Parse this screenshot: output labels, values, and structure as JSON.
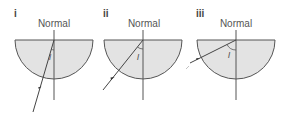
{
  "figure": {
    "panels": [
      {
        "id": "i",
        "label": "i",
        "normal_label": "Normal",
        "angle_label": "I",
        "center_x": 54,
        "ray_start": [
          37,
          112
        ],
        "ray_end": [
          54,
          40
        ]
      },
      {
        "id": "ii",
        "label": "ii",
        "normal_label": "Normal",
        "angle_label": "I",
        "center_x": 143,
        "ray_start": [
          103,
          90
        ],
        "ray_end": [
          143,
          40
        ]
      },
      {
        "id": "iii",
        "label": "iii",
        "normal_label": "Normal",
        "angle_label": "I",
        "center_x": 236,
        "ray_start": [
          190,
          63
        ],
        "ray_end": [
          236,
          40
        ]
      }
    ],
    "colors": {
      "block_fill": "#e3e3e3",
      "line": "#555555",
      "text": "#555555"
    }
  }
}
